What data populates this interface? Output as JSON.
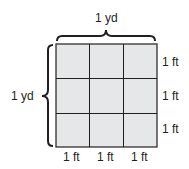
{
  "diagram": {
    "top_label": "1 yd",
    "left_label": "1 yd",
    "right_labels": [
      "1 ft",
      "1 ft",
      "1 ft"
    ],
    "bottom_labels": [
      "1 ft",
      "1 ft",
      "1 ft"
    ],
    "grid": {
      "rows": 3,
      "cols": 3
    },
    "colors": {
      "cell_fill": "#e6e7e8",
      "line": "#231f20"
    }
  }
}
